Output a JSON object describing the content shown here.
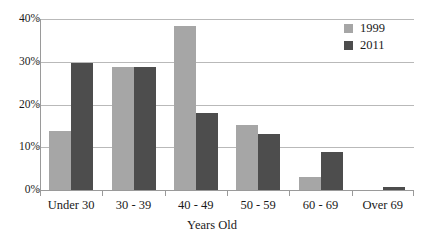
{
  "chart_data": {
    "type": "bar",
    "title": "",
    "xlabel": "Years Old",
    "ylabel": "",
    "categories": [
      "Under 30",
      "30 - 39",
      "40 - 49",
      "50 - 59",
      "60 - 69",
      "Over 69"
    ],
    "series": [
      {
        "name": "1999",
        "color": "#a6a6a6",
        "values": [
          13.8,
          28.8,
          38.3,
          15.2,
          3.0,
          0.0
        ]
      },
      {
        "name": "2011",
        "color": "#4d4d4d",
        "values": [
          29.7,
          28.7,
          17.9,
          13.2,
          8.9,
          0.7
        ]
      }
    ],
    "ylim": [
      0,
      40
    ],
    "yticks": [
      0,
      10,
      20,
      30,
      40
    ],
    "ytick_labels": [
      "0%",
      "10%",
      "20%",
      "30%",
      "40%"
    ],
    "grid": true,
    "legend_position": "top-right",
    "value_suffix": "%"
  }
}
